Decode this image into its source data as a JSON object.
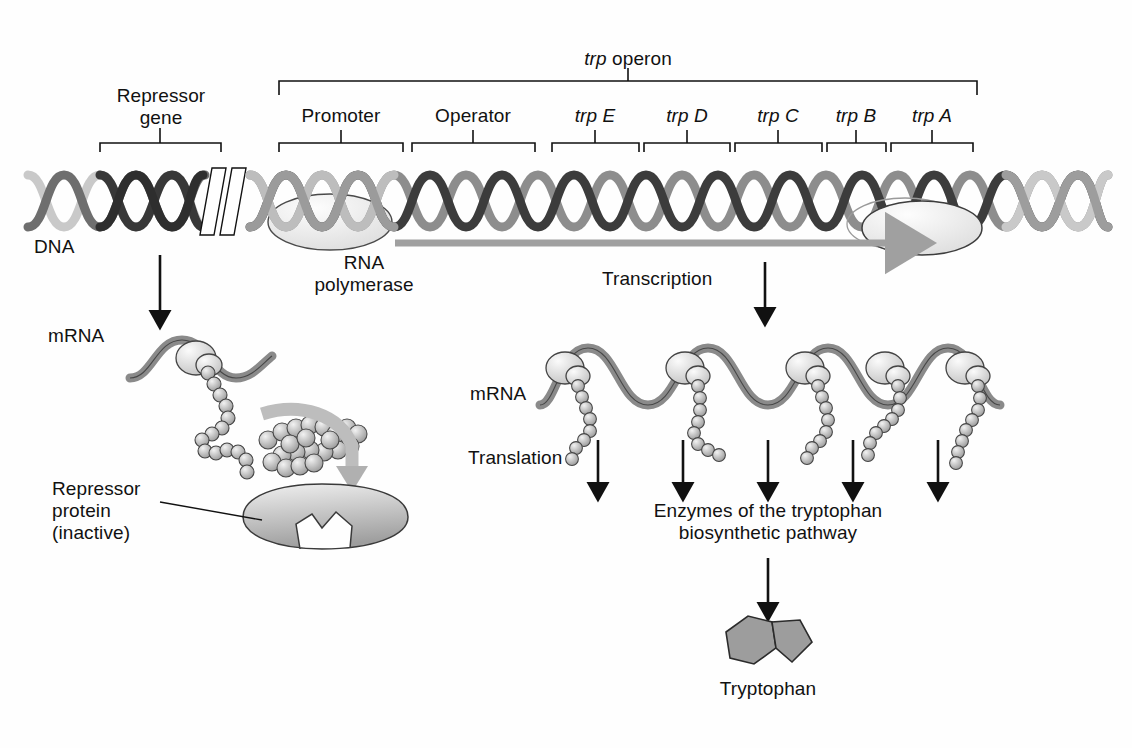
{
  "figure": {
    "background_color": "#fefefe",
    "ink_color": "#111111"
  },
  "dna_map": {
    "repressor_gene": {
      "label_line1": "Repressor",
      "label_line2": "gene"
    },
    "operon_bracket": {
      "label_italic": "trp",
      "label_rest": " operon"
    },
    "segments": [
      {
        "name": "promoter",
        "label": "Promoter",
        "italic_prefix": ""
      },
      {
        "name": "operator",
        "label": "Operator",
        "italic_prefix": ""
      },
      {
        "name": "trp-e",
        "label": " E",
        "italic_prefix": "trp"
      },
      {
        "name": "trp-d",
        "label": " D",
        "italic_prefix": "trp"
      },
      {
        "name": "trp-c",
        "label": " C",
        "italic_prefix": "trp"
      },
      {
        "name": "trp-b",
        "label": " B",
        "italic_prefix": "trp"
      },
      {
        "name": "trp-a",
        "label": " A",
        "italic_prefix": "trp"
      }
    ],
    "dna_label": "DNA"
  },
  "left_branch": {
    "mrna_label": "mRNA",
    "repressor_protein_label": "Repressor\nprotein\n(inactive)"
  },
  "right_branch": {
    "rna_polymerase_label": "RNA\npolymerase",
    "transcription_label": "Transcription",
    "mrna_label": "mRNA",
    "translation_label": "Translation",
    "enzymes_label": "Enzymes of the tryptophan\nbiosynthetic pathway",
    "product_label": "Tryptophan",
    "ribosome_count": 5
  },
  "colors": {
    "dna_strand_dark": "#3a3a3a",
    "dna_strand_mid": "#707070",
    "dna_strand_pale": "#c9c9c9",
    "mrna_ribbon": "#8a8a8a",
    "polymerase_fill": "#ededed",
    "protein_fill": "#b8b8b8",
    "arrow_gray": "#a0a0a0",
    "arrow_black": "#111111"
  }
}
